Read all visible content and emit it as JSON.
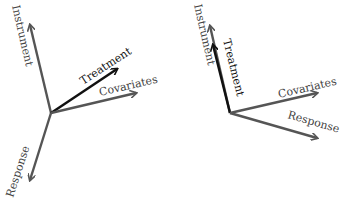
{
  "colors": {
    "background": "#ffffff",
    "gray_arrow": "#555555",
    "black_arrow": "#111111",
    "gray_text": "#444444",
    "black_text": "#111111"
  },
  "left_diagram": {
    "origin": [
      51,
      113
    ],
    "arrows": [
      {
        "name": "Instrument",
        "label": "Instrument",
        "end": [
          30,
          25
        ],
        "color": "gray"
      },
      {
        "name": "Treatment",
        "label": "Treatment",
        "end": [
          117,
          69
        ],
        "color": "black"
      },
      {
        "name": "Covariates",
        "label": "Covariates",
        "end": [
          136,
          93
        ],
        "color": "gray"
      },
      {
        "name": "Response",
        "label": "Response",
        "end": [
          30,
          180
        ],
        "color": "gray"
      }
    ]
  },
  "right_diagram": {
    "origin": [
      230,
      113
    ],
    "arrows": [
      {
        "name": "Instrument",
        "label": "Instrument",
        "end": [
          210,
          26
        ],
        "color": "gray"
      },
      {
        "name": "Treatment",
        "label": "Treatment",
        "end": [
          213,
          45
        ],
        "color": "black"
      },
      {
        "name": "Covariates",
        "label": "Covariates",
        "end": [
          317,
          93
        ],
        "color": "gray"
      },
      {
        "name": "Response",
        "label": "Response",
        "end": [
          317,
          138
        ],
        "color": "gray"
      }
    ]
  }
}
